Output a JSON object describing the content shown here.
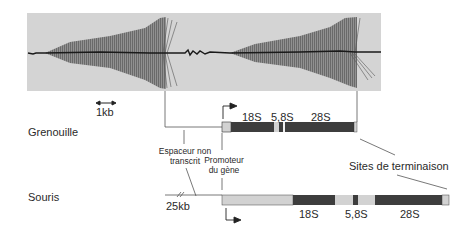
{
  "micrograph": {
    "background": "#d4d4d4",
    "scale_bar_label": "1kb"
  },
  "species": {
    "frog": {
      "label": "Grenouille",
      "segments": [
        {
          "type": "light",
          "from": 222,
          "to": 231
        },
        {
          "type": "dark",
          "from": 231,
          "to": 274
        },
        {
          "type": "light",
          "from": 274,
          "to": 279
        },
        {
          "type": "dark",
          "from": 279,
          "to": 283
        },
        {
          "type": "white",
          "from": 283,
          "to": 285
        },
        {
          "type": "dark",
          "from": 285,
          "to": 354
        },
        {
          "type": "light",
          "from": 354,
          "to": 357
        }
      ],
      "rrna_labels": [
        "18S",
        "5,8S",
        "28S"
      ]
    },
    "mouse": {
      "label": "Souris",
      "spacer_length_label": "25kb",
      "rrna_labels": [
        "18S",
        "5,8S",
        "28S"
      ]
    }
  },
  "annotations": {
    "spacer": "Espaceur non transcrit",
    "spacer_line1": "Espaceur non",
    "spacer_line2": "transcrit",
    "promoter_line1": "Promoteur",
    "promoter_line2": "du gène",
    "termination": "Sites de terminaison"
  },
  "colors": {
    "dark_segment": "#3d3d3d",
    "light_segment": "#d2d2d2",
    "line": "#555555"
  }
}
